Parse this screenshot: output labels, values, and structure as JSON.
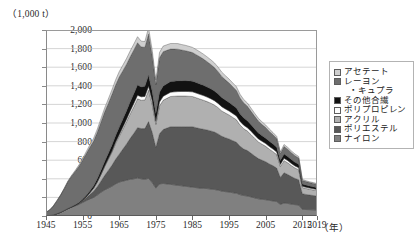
{
  "chart_data": {
    "type": "area",
    "title": "",
    "subtitle": "",
    "unit_label": "（1,000 t）",
    "xlabel": "（年）",
    "ylabel": "",
    "xlim": [
      1945,
      2019
    ],
    "ylim": [
      0,
      2000
    ],
    "grid": true,
    "stacked": true,
    "legend_position": "right",
    "ytick_labels": [
      "2,000",
      "1,800",
      "1,600",
      "1,400",
      "1,200",
      "1,000",
      "800",
      "600",
      "400",
      "200",
      "0"
    ],
    "ytick_values": [
      2000,
      1800,
      1600,
      1400,
      1200,
      1000,
      800,
      600,
      400,
      200,
      0
    ],
    "xtick_labels": [
      "1945",
      "1955",
      "1965",
      "1975",
      "1985",
      "1995",
      "2005",
      "2015",
      "2019"
    ],
    "xtick_values": [
      1945,
      1955,
      1965,
      1975,
      1985,
      1995,
      2005,
      2015,
      2019
    ],
    "x": [
      1945,
      1946,
      1947,
      1948,
      1949,
      1950,
      1951,
      1952,
      1953,
      1954,
      1955,
      1956,
      1957,
      1958,
      1959,
      1960,
      1961,
      1962,
      1963,
      1964,
      1965,
      1966,
      1967,
      1968,
      1969,
      1970,
      1971,
      1972,
      1973,
      1974,
      1975,
      1976,
      1977,
      1978,
      1979,
      1980,
      1981,
      1982,
      1983,
      1984,
      1985,
      1986,
      1987,
      1988,
      1989,
      1990,
      1991,
      1992,
      1993,
      1994,
      1995,
      1996,
      1997,
      1998,
      1999,
      2000,
      2001,
      2002,
      2003,
      2004,
      2005,
      2006,
      2007,
      2008,
      2009,
      2010,
      2011,
      2012,
      2013,
      2014,
      2015,
      2016,
      2017,
      2018,
      2019
    ],
    "series": [
      {
        "name": "ナイロン",
        "color": "#808080",
        "stack_order": 1,
        "values": [
          2,
          5,
          12,
          25,
          40,
          60,
          80,
          95,
          110,
          125,
          145,
          165,
          185,
          200,
          225,
          255,
          280,
          300,
          320,
          345,
          365,
          375,
          385,
          395,
          400,
          410,
          400,
          395,
          405,
          360,
          300,
          345,
          350,
          345,
          340,
          335,
          330,
          325,
          320,
          315,
          310,
          305,
          300,
          298,
          295,
          290,
          285,
          278,
          268,
          262,
          258,
          250,
          245,
          230,
          220,
          215,
          205,
          195,
          185,
          180,
          175,
          168,
          162,
          155,
          125,
          140,
          135,
          128,
          122,
          118,
          72,
          70,
          68,
          66,
          64
        ]
      },
      {
        "name": "ポリエステル",
        "color": "#585858",
        "stack_order": 2,
        "values": [
          0,
          0,
          0,
          0,
          0,
          0,
          0,
          2,
          5,
          10,
          18,
          30,
          45,
          65,
          90,
          120,
          155,
          190,
          225,
          265,
          300,
          345,
          390,
          440,
          490,
          540,
          540,
          545,
          610,
          540,
          440,
          540,
          580,
          600,
          620,
          625,
          630,
          635,
          640,
          645,
          650,
          645,
          640,
          635,
          630,
          625,
          618,
          605,
          590,
          580,
          570,
          560,
          548,
          520,
          500,
          488,
          470,
          450,
          432,
          420,
          408,
          392,
          378,
          360,
          290,
          325,
          312,
          296,
          282,
          272,
          168,
          162,
          158,
          154,
          150
        ]
      },
      {
        "name": "アクリル",
        "color": "#b0b0b0",
        "stack_order": 3,
        "values": [
          0,
          0,
          0,
          0,
          0,
          0,
          0,
          0,
          1,
          3,
          6,
          12,
          22,
          35,
          52,
          72,
          95,
          118,
          142,
          168,
          192,
          215,
          240,
          265,
          288,
          310,
          305,
          308,
          338,
          300,
          245,
          300,
          315,
          320,
          325,
          328,
          330,
          330,
          330,
          328,
          325,
          322,
          318,
          312,
          305,
          298,
          290,
          282,
          272,
          265,
          258,
          250,
          242,
          228,
          218,
          210,
          200,
          190,
          180,
          172,
          166,
          158,
          152,
          145,
          118,
          130,
          125,
          118,
          112,
          108,
          66,
          64,
          62,
          60,
          58
        ]
      },
      {
        "name": "ポリプロピレン",
        "color": "#fdfdfd",
        "stack_order": 4,
        "values": [
          0,
          0,
          0,
          0,
          0,
          0,
          0,
          0,
          0,
          0,
          0,
          0,
          0,
          0,
          0,
          2,
          4,
          7,
          10,
          14,
          18,
          22,
          26,
          30,
          34,
          38,
          37,
          38,
          42,
          38,
          32,
          40,
          42,
          44,
          46,
          47,
          48,
          49,
          50,
          50,
          50,
          50,
          50,
          50,
          49,
          48,
          47,
          46,
          45,
          44,
          43,
          42,
          41,
          39,
          38,
          37,
          35,
          34,
          32,
          31,
          30,
          29,
          28,
          27,
          22,
          25,
          24,
          23,
          22,
          21,
          13,
          13,
          12,
          12,
          12
        ]
      },
      {
        "name": "その他合繊",
        "color": "#121212",
        "stack_order": 5,
        "values": [
          0,
          0,
          0,
          0,
          0,
          0,
          1,
          2,
          4,
          7,
          10,
          14,
          20,
          26,
          33,
          40,
          48,
          56,
          64,
          72,
          80,
          86,
          92,
          98,
          104,
          110,
          106,
          108,
          118,
          104,
          86,
          106,
          110,
          112,
          114,
          115,
          116,
          116,
          116,
          115,
          114,
          113,
          112,
          110,
          108,
          106,
          104,
          101,
          98,
          95,
          92,
          89,
          86,
          81,
          78,
          75,
          71,
          67,
          64,
          61,
          58,
          56,
          53,
          51,
          41,
          46,
          44,
          42,
          40,
          38,
          24,
          23,
          22,
          22,
          21
        ]
      },
      {
        "name": "レーヨン・キュプラ",
        "color": "#6e6e6e",
        "stack_order": 6,
        "values": [
          38,
          60,
          95,
          140,
          185,
          235,
          290,
          330,
          360,
          390,
          420,
          450,
          470,
          480,
          500,
          520,
          535,
          540,
          545,
          545,
          540,
          520,
          500,
          485,
          470,
          455,
          430,
          420,
          445,
          385,
          310,
          370,
          370,
          360,
          350,
          345,
          340,
          330,
          322,
          315,
          308,
          300,
          292,
          282,
          272,
          262,
          252,
          240,
          228,
          218,
          208,
          198,
          188,
          172,
          162,
          155,
          145,
          136,
          128,
          120,
          114,
          106,
          100,
          94,
          74,
          82,
          78,
          74,
          70,
          66,
          40,
          38,
          37,
          36,
          35
        ]
      },
      {
        "name": "アセテート",
        "color": "#cfcfcf",
        "stack_order": 7,
        "values": [
          0,
          0,
          0,
          1,
          2,
          4,
          6,
          9,
          12,
          15,
          18,
          22,
          26,
          30,
          34,
          38,
          42,
          46,
          50,
          54,
          58,
          60,
          62,
          63,
          64,
          65,
          62,
          62,
          66,
          58,
          48,
          58,
          60,
          60,
          60,
          60,
          60,
          59,
          58,
          57,
          56,
          55,
          54,
          53,
          52,
          51,
          50,
          48,
          46,
          45,
          43,
          42,
          40,
          38,
          36,
          35,
          33,
          31,
          29,
          28,
          27,
          26,
          24,
          23,
          19,
          21,
          20,
          19,
          18,
          17,
          10,
          10,
          9,
          9,
          9
        ]
      }
    ]
  },
  "legend": {
    "items": [
      {
        "label": "アセテート",
        "sub": "",
        "swatch": "#cfcfcf"
      },
      {
        "label": "レーヨン",
        "sub": "・キュプラ",
        "swatch": "#6e6e6e"
      },
      {
        "label": "その他合繊",
        "sub": "",
        "swatch": "#121212"
      },
      {
        "label": "ポリプロピレン",
        "sub": "",
        "swatch": "#fdfdfd"
      },
      {
        "label": "アクリル",
        "sub": "",
        "swatch": "#b0b0b0"
      },
      {
        "label": "ポリエステル",
        "sub": "",
        "swatch": "#585858"
      },
      {
        "label": "ナイロン",
        "sub": "",
        "swatch": "#808080"
      }
    ]
  }
}
